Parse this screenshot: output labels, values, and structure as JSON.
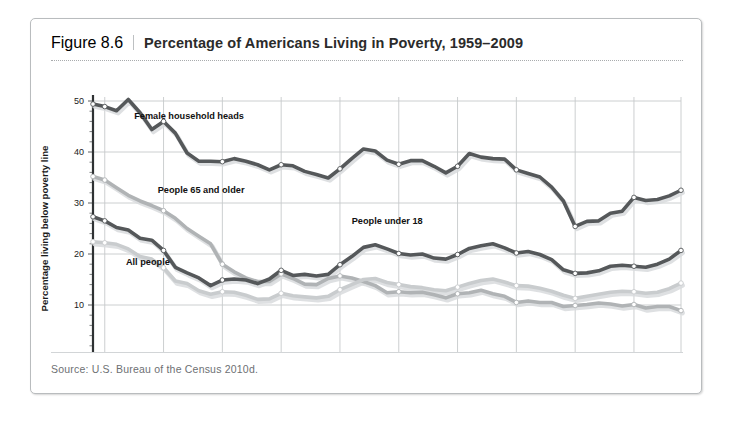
{
  "figure": {
    "number": "Figure 8.6",
    "title": "Percentage of Americans Living in Poverty, 1959–2009",
    "source": "Source: U.S. Bureau of the Census 2010d."
  },
  "chart_data": {
    "type": "line",
    "title": "Percentage of Americans Living in Poverty, 1959–2009",
    "xlabel": "",
    "ylabel": "Percentage living below poverty line",
    "xlim": [
      1959,
      2009
    ],
    "ylim": [
      0,
      50
    ],
    "yticks": [
      0,
      10,
      20,
      30,
      40,
      50
    ],
    "xticks": [
      1960,
      1965,
      1970,
      1975,
      1980,
      1985,
      1990,
      1995,
      2000,
      2005,
      2009
    ],
    "grid": true,
    "legend_position": "inline-annotations",
    "x": [
      1959,
      1960,
      1961,
      1962,
      1963,
      1964,
      1965,
      1966,
      1967,
      1968,
      1969,
      1970,
      1971,
      1972,
      1973,
      1974,
      1975,
      1976,
      1977,
      1978,
      1979,
      1980,
      1981,
      1982,
      1983,
      1984,
      1985,
      1986,
      1987,
      1988,
      1989,
      1990,
      1991,
      1992,
      1993,
      1994,
      1995,
      1996,
      1997,
      1998,
      1999,
      2000,
      2001,
      2002,
      2003,
      2004,
      2005,
      2006,
      2007,
      2008,
      2009
    ],
    "series": [
      {
        "name": "Female household heads",
        "color": "#55585a",
        "label_x": 1962.5,
        "label_y": 46.5,
        "values": [
          49.4,
          48.9,
          48.1,
          50.3,
          47.7,
          44.4,
          46.0,
          43.7,
          39.8,
          38.2,
          38.2,
          38.1,
          38.7,
          38.2,
          37.5,
          36.5,
          37.5,
          37.3,
          36.2,
          35.6,
          34.9,
          36.7,
          38.7,
          40.6,
          40.2,
          38.4,
          37.6,
          38.3,
          38.3,
          37.2,
          35.9,
          37.2,
          39.7,
          39.0,
          38.7,
          38.6,
          36.5,
          35.8,
          35.1,
          33.1,
          30.4,
          25.4,
          26.4,
          26.5,
          28.0,
          28.4,
          31.1,
          30.5,
          30.7,
          31.4,
          32.5
        ]
      },
      {
        "name": "People 65 and older",
        "color": "#b0b3b5",
        "label_x": 1964.5,
        "label_y": 32.0,
        "values": [
          35.2,
          34.5,
          33.0,
          31.5,
          30.4,
          29.5,
          28.5,
          27.0,
          25.0,
          23.5,
          22.0,
          18.0,
          16.5,
          15.3,
          14.6,
          14.6,
          16.1,
          15.2,
          14.1,
          14.0,
          15.2,
          15.7,
          15.3,
          14.6,
          13.8,
          12.4,
          12.6,
          12.4,
          12.5,
          12.0,
          11.4,
          12.2,
          12.4,
          12.9,
          12.2,
          11.7,
          10.5,
          10.8,
          10.5,
          10.5,
          9.7,
          9.9,
          10.1,
          10.4,
          10.2,
          9.8,
          10.1,
          9.4,
          9.7,
          9.7,
          8.9
        ]
      },
      {
        "name": "People under 18",
        "color": "#55585a",
        "label_x": 1981.0,
        "label_y": 25.9,
        "values": [
          27.3,
          26.5,
          25.2,
          24.7,
          23.1,
          22.7,
          20.7,
          17.4,
          16.3,
          15.3,
          13.8,
          14.9,
          15.1,
          14.9,
          14.2,
          15.1,
          16.8,
          15.8,
          16.0,
          15.7,
          16.0,
          17.9,
          19.5,
          21.3,
          21.8,
          21.0,
          20.1,
          19.8,
          20.0,
          19.2,
          19.0,
          19.9,
          21.1,
          21.6,
          22.0,
          21.2,
          20.2,
          20.5,
          19.9,
          18.9,
          16.9,
          16.2,
          16.3,
          16.7,
          17.6,
          17.8,
          17.6,
          17.4,
          18.0,
          19.0,
          20.7
        ]
      },
      {
        "name": "All people",
        "color": "#c9ccce",
        "label_x": 1961.8,
        "label_y": 17.8,
        "values": [
          22.4,
          22.2,
          21.9,
          21.0,
          19.5,
          19.0,
          17.3,
          14.7,
          14.2,
          12.8,
          12.1,
          12.6,
          12.5,
          11.9,
          11.1,
          11.2,
          12.3,
          11.8,
          11.6,
          11.4,
          11.7,
          13.0,
          14.0,
          15.0,
          15.2,
          14.4,
          14.0,
          13.6,
          13.4,
          13.0,
          12.8,
          13.5,
          14.2,
          14.8,
          15.1,
          14.5,
          13.8,
          13.7,
          13.3,
          12.7,
          11.9,
          11.3,
          11.7,
          12.1,
          12.5,
          12.7,
          12.6,
          12.3,
          12.5,
          13.2,
          14.3
        ]
      }
    ]
  }
}
